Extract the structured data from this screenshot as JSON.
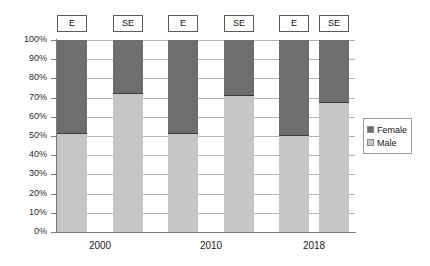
{
  "chart_data": {
    "type": "bar",
    "title": "",
    "subtitle": "",
    "xlabel": "",
    "ylabel": "",
    "stacked": true,
    "stack_mode": "percent",
    "grid": true,
    "legend_position": "right",
    "ylim": [
      0,
      100
    ],
    "ytick_labels": [
      "100%",
      "90%",
      "80%",
      "70%",
      "60%",
      "50%",
      "40%",
      "30%",
      "20%",
      "10%",
      "0%"
    ],
    "ytick_values": [
      100,
      90,
      80,
      70,
      60,
      50,
      40,
      30,
      20,
      10,
      0
    ],
    "groups": [
      "2000",
      "2010",
      "2018"
    ],
    "categories": [
      "E",
      "SE",
      "E",
      "SE",
      "E",
      "SE"
    ],
    "bar_labels": [
      "E",
      "SE",
      "E",
      "SE",
      "E",
      "SE"
    ],
    "series": [
      {
        "name": "Female",
        "color": "#6e6e6e",
        "values": [
          49,
          28,
          49,
          29,
          50,
          33
        ]
      },
      {
        "name": "Male",
        "color": "#c6c6c6",
        "values": [
          51,
          72,
          51,
          71,
          50,
          67
        ]
      }
    ],
    "bars": [
      {
        "label": "E",
        "group": "2000",
        "male": 51,
        "female": 49
      },
      {
        "label": "SE",
        "group": "2000",
        "male": 72,
        "female": 28
      },
      {
        "label": "E",
        "group": "2010",
        "male": 51,
        "female": 49
      },
      {
        "label": "SE",
        "group": "2010",
        "male": 71,
        "female": 29
      },
      {
        "label": "E",
        "group": "2018",
        "male": 50,
        "female": 50
      },
      {
        "label": "SE",
        "group": "2018",
        "male": 67,
        "female": 33
      }
    ],
    "legend": [
      {
        "label": "Female",
        "color": "#6e6e6e"
      },
      {
        "label": "Male",
        "color": "#c6c6c6"
      }
    ]
  },
  "colors": {
    "female": "#6e6e6e",
    "male": "#c6c6c6",
    "gridline": "#b4b4b4",
    "axis": "#7a7a7a",
    "background": "#ffffff"
  }
}
